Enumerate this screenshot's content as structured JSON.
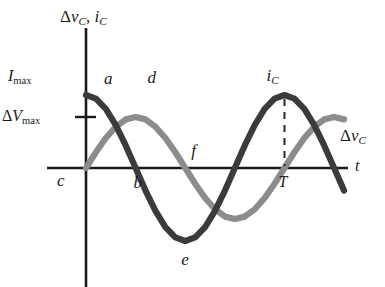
{
  "figure": {
    "axes": {
      "y_label": "Δv_C, i_C",
      "y_label_parts": {
        "delta": "Δ",
        "v": "v",
        "v_sub": "C",
        "sep": ", ",
        "i": "i",
        "i_sub": "C"
      },
      "x_label": "t",
      "x_axis_y_px": 168,
      "y_axis_x_px": 86,
      "x_axis_range_px": [
        47,
        348
      ],
      "y_axis_range_px": [
        28,
        287
      ]
    },
    "tick_labels": [
      {
        "name": "I_max",
        "text_main": "I",
        "text_sub": "max",
        "value_px_y": 95,
        "has_tick": false
      },
      {
        "name": "Delta_V_max",
        "text_delta": "Δ",
        "text_main": "V",
        "text_sub": "max",
        "value_px_y": 117,
        "has_tick": true
      }
    ],
    "point_labels": [
      {
        "id": "a",
        "text": "a",
        "desc": "current curve just after t=0, descending"
      },
      {
        "id": "b",
        "text": "b",
        "desc": "current curve zero crossing (descending)"
      },
      {
        "id": "c",
        "text": "c",
        "desc": "origin region on time axis"
      },
      {
        "id": "d",
        "text": "d",
        "desc": "voltage curve positive maximum"
      },
      {
        "id": "e",
        "text": "e",
        "desc": "current curve negative minimum"
      },
      {
        "id": "f",
        "text": "f",
        "desc": "voltage curve descending through axis"
      },
      {
        "id": "T",
        "text": "T",
        "desc": "one full period on time axis"
      }
    ],
    "curve_labels": [
      {
        "id": "i_C",
        "main": "i",
        "sub": "C",
        "delta": "",
        "desc": "current curve peak annotation with dashed drop line to T"
      },
      {
        "id": "delta_vC",
        "main": "v",
        "sub": "C",
        "delta": "Δ",
        "desc": "voltage curve right-hand label"
      }
    ],
    "colors": {
      "current_curve": "#3b3b3b",
      "voltage_curve": "#8c8c8c",
      "axis": "#1a1a1a",
      "label_text": "#1a1a1a",
      "background": "#ffffff",
      "dashed_line": "#2a2a2a"
    }
  },
  "chart_data": {
    "type": "line",
    "xlabel": "t",
    "ylabel": "Δv_C, i_C",
    "xlim": [
      0,
      1.32
    ],
    "ylim": [
      -1.15,
      1.15
    ],
    "grid": false,
    "legend": "inline curve labels",
    "x_tick_labels": [
      "c",
      "b",
      "T"
    ],
    "y_tick_labels": [
      "I_max",
      "ΔV_max"
    ],
    "annotations": [
      {
        "label": "a",
        "x": 0.06,
        "y": 0.93,
        "curve": "i_C"
      },
      {
        "label": "b",
        "x": 0.25,
        "y": 0.0,
        "curve": "i_C"
      },
      {
        "label": "c",
        "x": 0.0,
        "y": 0.0,
        "curve": "axis-origin"
      },
      {
        "label": "d",
        "x": 0.25,
        "y": 1.0,
        "curve": "delta_v_C"
      },
      {
        "label": "e",
        "x": 0.5,
        "y": -1.0,
        "curve": "i_C"
      },
      {
        "label": "f",
        "x": 0.5,
        "y": 0.0,
        "curve": "delta_v_C"
      },
      {
        "label": "T",
        "x": 1.0,
        "y": 0.0,
        "curve": "axis"
      },
      {
        "label": "i_C",
        "x": 0.99,
        "y": 1.0,
        "curve": "i_C"
      },
      {
        "label": "Δv_C",
        "x": 1.28,
        "y": 0.42,
        "curve": "delta_v_C"
      }
    ],
    "dashed_guides": [
      {
        "from": [
          1.0,
          1.0
        ],
        "to": [
          1.0,
          0.0
        ],
        "style": "dashed",
        "desc": "peak of i_C down to T on axis"
      }
    ],
    "series": [
      {
        "name": "i_C",
        "color": "#3b3b3b",
        "amplitude": 1.0,
        "amplitude_label": "I_max",
        "phase_deg": 90,
        "period": 1.0,
        "formula": "i_C = I_max * cos(2*pi*t/T)",
        "x": [
          0.0,
          0.05,
          0.1,
          0.15,
          0.2,
          0.25,
          0.3,
          0.35,
          0.4,
          0.45,
          0.5,
          0.55,
          0.6,
          0.65,
          0.7,
          0.75,
          0.8,
          0.85,
          0.9,
          0.95,
          1.0,
          1.05,
          1.1,
          1.15,
          1.2,
          1.25,
          1.3
        ],
        "y": [
          1.0,
          0.951,
          0.809,
          0.588,
          0.309,
          0.0,
          -0.309,
          -0.588,
          -0.809,
          -0.951,
          -1.0,
          -0.951,
          -0.809,
          -0.588,
          -0.309,
          0.0,
          0.309,
          0.588,
          0.809,
          0.951,
          1.0,
          0.951,
          0.809,
          0.588,
          0.309,
          0.0,
          -0.309
        ]
      },
      {
        "name": "Δv_C",
        "color": "#8c8c8c",
        "amplitude": 0.7,
        "amplitude_label": "ΔV_max",
        "phase_deg": 0,
        "period": 1.0,
        "formula": "Δv_C = ΔV_max * sin(2*pi*t/T)",
        "x": [
          0.0,
          0.05,
          0.1,
          0.15,
          0.2,
          0.25,
          0.3,
          0.35,
          0.4,
          0.45,
          0.5,
          0.55,
          0.6,
          0.65,
          0.7,
          0.75,
          0.8,
          0.85,
          0.9,
          0.95,
          1.0,
          1.05,
          1.1,
          1.15,
          1.2,
          1.25,
          1.3
        ],
        "y": [
          0.0,
          0.216,
          0.411,
          0.566,
          0.666,
          0.7,
          0.666,
          0.566,
          0.411,
          0.216,
          0.0,
          -0.216,
          -0.411,
          -0.566,
          -0.666,
          -0.7,
          -0.666,
          -0.566,
          -0.411,
          -0.216,
          0.0,
          0.216,
          0.411,
          0.566,
          0.666,
          0.7,
          0.666
        ]
      }
    ]
  }
}
